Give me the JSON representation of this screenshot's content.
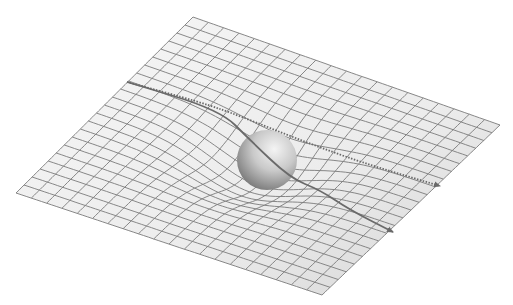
{
  "figure": {
    "width": 513,
    "height": 305,
    "background": "#ffffff"
  },
  "plane": {
    "corners": {
      "top": [
        193,
        17
      ],
      "right": [
        500,
        125
      ],
      "bottom": [
        322,
        295
      ],
      "left": [
        16,
        193
      ]
    },
    "grid_divisions_u": 20,
    "grid_divisions_v": 22,
    "fill_light": "#f4f4f4",
    "fill_dark": "#d6d6d6",
    "line_color": "#7a7a7a"
  },
  "well": {
    "center_uv": [
      0.5,
      0.5
    ],
    "depth_px": 28,
    "radius_uv": 0.2
  },
  "sphere": {
    "cx": 267,
    "cy": 160,
    "r": 30,
    "highlight": "#f2f2f2",
    "shade": "#6e6e6e"
  },
  "paths": [
    {
      "name": "straight-path-deflected",
      "style": "dotted-then-solid",
      "points": [
        [
          127,
          82
        ],
        [
          200,
          102
        ],
        [
          240,
          116
        ],
        [
          300,
          140
        ],
        [
          360,
          162
        ],
        [
          440,
          186
        ]
      ],
      "color": "#6a6a6a"
    },
    {
      "name": "bent-path",
      "style": "solid",
      "points": [
        [
          127,
          82
        ],
        [
          220,
          110
        ],
        [
          250,
          140
        ],
        [
          290,
          178
        ],
        [
          320,
          190
        ],
        [
          350,
          210
        ],
        [
          393,
          232
        ]
      ],
      "color": "#6a6a6a"
    }
  ]
}
